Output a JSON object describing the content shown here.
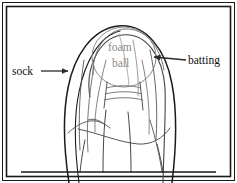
{
  "figure": {
    "background_color": "#ffffff",
    "border": {
      "outer_color": "#1a1a1a",
      "inner_color": "#1a1a1a",
      "style": "double-rule rectangle frame"
    },
    "line_colors": {
      "outline_dark": "#1a1a1a",
      "outline_mid": "#555555",
      "outline_light": "#8a8a8a",
      "label_dark": "#111111",
      "label_gray": "#8a8a8a",
      "arrow": "#2b2b2b"
    }
  },
  "labels": [
    {
      "id": "sock",
      "text": "sock",
      "color": "#111111",
      "x": 12,
      "y": 75,
      "anchor": "start",
      "arrow": {
        "name": "sock-arrow",
        "direction": "right",
        "from_x": 41,
        "from_y": 71,
        "to_x": 70,
        "to_y": 71
      }
    },
    {
      "id": "batting",
      "text": "batting",
      "color": "#111111",
      "x": 188,
      "y": 64,
      "anchor": "start",
      "arrow": {
        "name": "batting-arrow",
        "direction": "left",
        "from_x": 186,
        "from_y": 60,
        "to_x": 152,
        "to_y": 57
      }
    },
    {
      "id": "foam",
      "text": "foam",
      "color": "#8a8a8a",
      "x": 108,
      "y": 51,
      "anchor": "start",
      "arrow": null
    },
    {
      "id": "ball",
      "text": "ball",
      "color": "#8a8a8a",
      "x": 112,
      "y": 67,
      "anchor": "start",
      "arrow": null
    }
  ],
  "drawing": {
    "foam_ball": {
      "name": "foam-ball-circle",
      "cx": 124,
      "cy": 57,
      "rx": 32,
      "ry": 30,
      "stroke": "#8a8a8a"
    },
    "ground_line": {
      "name": "ground-line",
      "x1": 21,
      "y1": 172,
      "x2": 216,
      "y2": 172,
      "stroke": "#1a1a1a"
    }
  }
}
